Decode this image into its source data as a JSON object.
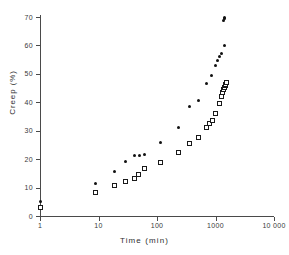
{
  "chart_data": {
    "type": "scatter",
    "title": "",
    "xlabel": "Time  (min)",
    "ylabel": "Creep  (%)",
    "xscale": "log",
    "yscale": "linear",
    "xlim": [
      1,
      10000
    ],
    "ylim": [
      0,
      70
    ],
    "grid": false,
    "legend": "none",
    "xticks": [
      1,
      10,
      100,
      1000,
      10000
    ],
    "xticklabels": [
      "1",
      "10",
      "100",
      "1000",
      "10 000"
    ],
    "yticks": [
      0,
      10,
      20,
      30,
      40,
      50,
      60,
      70
    ],
    "yticklabels": [
      "0",
      "10",
      "20",
      "30",
      "40",
      "50",
      "60",
      "70"
    ],
    "series": [
      {
        "name": "filled-circles",
        "marker": "filled-circle",
        "color": "#111111",
        "points": [
          [
            1,
            5.0
          ],
          [
            9,
            11.3
          ],
          [
            19,
            15.7
          ],
          [
            29,
            19.2
          ],
          [
            42,
            21.2
          ],
          [
            50,
            21.3
          ],
          [
            60,
            21.7
          ],
          [
            115,
            25.9
          ],
          [
            235,
            31.2
          ],
          [
            355,
            38.6
          ],
          [
            520,
            40.7
          ],
          [
            700,
            46.5
          ],
          [
            870,
            49.5
          ],
          [
            1000,
            53.0
          ],
          [
            1090,
            54.6
          ],
          [
            1180,
            56.2
          ],
          [
            1290,
            57.3
          ],
          [
            1420,
            60.0
          ],
          [
            1380,
            68.6
          ],
          [
            1400,
            69.3
          ],
          [
            1420,
            69.8
          ]
        ]
      },
      {
        "name": "open-squares",
        "marker": "open-square",
        "color": "#1a1a1a",
        "points": [
          [
            1,
            2.9
          ],
          [
            9,
            8.3
          ],
          [
            19,
            10.6
          ],
          [
            29,
            12.1
          ],
          [
            41,
            13.1
          ],
          [
            49,
            14.5
          ],
          [
            60,
            16.8
          ],
          [
            115,
            18.7
          ],
          [
            235,
            22.4
          ],
          [
            355,
            25.4
          ],
          [
            520,
            27.5
          ],
          [
            700,
            31.2
          ],
          [
            800,
            32.5
          ],
          [
            880,
            33.5
          ],
          [
            1000,
            36.0
          ],
          [
            1160,
            39.4
          ],
          [
            1290,
            42.0
          ],
          [
            1340,
            43.5
          ],
          [
            1380,
            44.4
          ],
          [
            1420,
            45.1
          ],
          [
            1460,
            45.8
          ],
          [
            1500,
            46.4
          ],
          [
            1540,
            46.9
          ]
        ]
      }
    ]
  }
}
